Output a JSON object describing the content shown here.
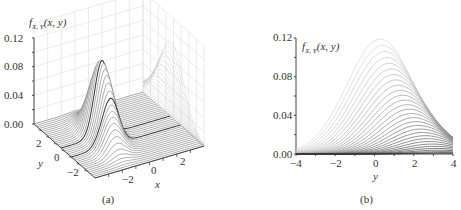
{
  "chart_data": [
    {
      "panel": "(a)",
      "type": "surface3d",
      "title": "",
      "zlabel": "f_{X,Y}(x, y)",
      "xlabel": "x",
      "ylabel": "y",
      "z_ticks": [
        "0.00",
        "0.04",
        "0.08",
        "0.12"
      ],
      "x_ticks": [
        "−2",
        "0",
        "2"
      ],
      "y_ticks": [
        "2",
        "0",
        "−2"
      ],
      "zlim": [
        0,
        0.12
      ],
      "xlim": [
        -4,
        4
      ],
      "ylim": [
        -4,
        4
      ],
      "grid": true,
      "peak": {
        "x": -1,
        "y": 0.5,
        "z": 0.105
      },
      "description": "3D wireframe surface of a joint pdf with a single peak (~0.105) near x≈-1, projected line profiles on the back wall"
    },
    {
      "panel": "(b)",
      "type": "line",
      "title": "",
      "xlabel": "y",
      "ylabel": "f_{X,Y}(x, y)",
      "x_ticks": [
        "−4",
        "−2",
        "0",
        "2",
        "4"
      ],
      "y_ticks": [
        "0.00",
        "0.04",
        "0.08",
        "0.12"
      ],
      "xlim": [
        -4,
        4
      ],
      "ylim": [
        0,
        0.12
      ],
      "grid": false,
      "series_description": "Family of ~30 bell-shaped curves over y for different x slices; amplitude decreases from ~0.118 (lightest) to ~0 (darkest); peak location shifts from y≈0.3 toward y≈3.5 as amplitude decreases",
      "series": [
        {
          "name": "slice-1",
          "peak_y": 0.3,
          "peak_value": 0.118,
          "value_at_-4": 0.018,
          "value_at_4": 0.014
        },
        {
          "name": "slice-5",
          "peak_y": 0.7,
          "peak_value": 0.095,
          "value_at_-4": 0.012,
          "value_at_4": 0.016
        },
        {
          "name": "slice-10",
          "peak_y": 1.2,
          "peak_value": 0.068,
          "value_at_-4": 0.008,
          "value_at_4": 0.017
        },
        {
          "name": "slice-15",
          "peak_y": 1.8,
          "peak_value": 0.045,
          "value_at_-4": 0.005,
          "value_at_4": 0.017
        },
        {
          "name": "slice-20",
          "peak_y": 2.4,
          "peak_value": 0.026,
          "value_at_-4": 0.003,
          "value_at_4": 0.015
        },
        {
          "name": "slice-25",
          "peak_y": 3.0,
          "peak_value": 0.012,
          "value_at_-4": 0.001,
          "value_at_4": 0.01
        },
        {
          "name": "slice-30",
          "peak_y": 3.6,
          "peak_value": 0.003,
          "value_at_-4": 0.0,
          "value_at_4": 0.003
        }
      ]
    }
  ],
  "panel_a": {
    "fn_label": "f",
    "fn_sub": "X, Y",
    "fn_args": "(x, y)",
    "z_ticks": [
      "0.12",
      "0.08",
      "0.04",
      "0.00"
    ],
    "y_ticks": [
      "2",
      "0",
      "−2"
    ],
    "y_title": "y",
    "x_ticks": [
      "−2",
      "0",
      "2"
    ],
    "x_title": "x",
    "caption": "(a)"
  },
  "panel_b": {
    "fn_label": "f",
    "fn_sub": "X, Y",
    "fn_args": "(x, y)",
    "y_ticks": [
      "0.12",
      "0.08",
      "0.04",
      "0.00"
    ],
    "x_ticks": [
      "−4",
      "−2",
      "0",
      "2",
      "4"
    ],
    "x_title": "y",
    "caption": "(b)"
  }
}
